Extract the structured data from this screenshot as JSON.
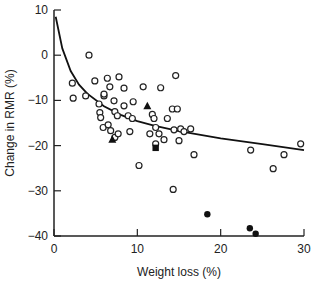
{
  "chart_data": {
    "type": "scatter",
    "title": "",
    "xlabel": "Weight loss (%)",
    "ylabel": "Change in RMR (%)",
    "xlim": [
      0,
      30
    ],
    "ylim": [
      -40,
      10
    ],
    "xticks": [
      0,
      10,
      20,
      30
    ],
    "yticks": [
      10,
      0,
      -10,
      -20,
      -30,
      -40
    ],
    "grid": false,
    "legend": null,
    "series": [
      {
        "name": "open circles",
        "marker": "circle-open",
        "points": [
          [
            4.2,
            0
          ],
          [
            2.2,
            -6.2
          ],
          [
            2.3,
            -9.5
          ],
          [
            4.9,
            -5.7
          ],
          [
            6.4,
            -5.1
          ],
          [
            7.8,
            -4.8
          ],
          [
            3.8,
            -9.0
          ],
          [
            6.0,
            -9.0
          ],
          [
            6.0,
            -8.6
          ],
          [
            6.7,
            -7.0
          ],
          [
            8.4,
            -7.3
          ],
          [
            10.7,
            -7.0
          ],
          [
            5.4,
            -10.8
          ],
          [
            7.2,
            -10.1
          ],
          [
            8.4,
            -11.2
          ],
          [
            9.5,
            -10.3
          ],
          [
            7.3,
            -12.5
          ],
          [
            7.6,
            -13.4
          ],
          [
            8.9,
            -13.4
          ],
          [
            9.4,
            -14.0
          ],
          [
            5.5,
            -12.7
          ],
          [
            5.6,
            -13.8
          ],
          [
            5.9,
            -16.0
          ],
          [
            6.5,
            -15.4
          ],
          [
            6.8,
            -16.7
          ],
          [
            7.3,
            -18.2
          ],
          [
            7.7,
            -17.4
          ],
          [
            9.1,
            -16.9
          ],
          [
            10.2,
            -24.4
          ],
          [
            14.6,
            -4.5
          ],
          [
            12.8,
            -7.2
          ],
          [
            11.8,
            -13.1
          ],
          [
            12.2,
            -16.0
          ],
          [
            12.0,
            -14.0
          ],
          [
            11.5,
            -17.4
          ],
          [
            12.6,
            -17.4
          ],
          [
            13.6,
            -14.0
          ],
          [
            14.2,
            -11.9
          ],
          [
            14.8,
            -11.9
          ],
          [
            14.4,
            -16.5
          ],
          [
            13.2,
            -18.7
          ],
          [
            15.2,
            -16.3
          ],
          [
            15.6,
            -16.9
          ],
          [
            16.4,
            -16.3
          ],
          [
            15.0,
            -18.9
          ],
          [
            16.8,
            -22.0
          ],
          [
            14.3,
            -29.7
          ],
          [
            23.6,
            -21.0
          ],
          [
            27.6,
            -22.0
          ],
          [
            26.3,
            -25.1
          ],
          [
            29.6,
            -19.6
          ],
          [
            12.2,
            -19.6
          ]
        ]
      },
      {
        "name": "filled triangles",
        "marker": "triangle-filled",
        "points": [
          [
            7.0,
            -18.7
          ],
          [
            11.2,
            -11.3
          ]
        ]
      },
      {
        "name": "filled square",
        "marker": "square-filled",
        "points": [
          [
            12.2,
            -20.5
          ]
        ]
      },
      {
        "name": "filled circles",
        "marker": "circle-filled",
        "points": [
          [
            18.4,
            -35.2
          ],
          [
            23.5,
            -38.3
          ],
          [
            24.2,
            -39.5
          ]
        ]
      }
    ],
    "fit_curve": {
      "description": "decreasing fitted curve",
      "points": [
        [
          0.2,
          8.5
        ],
        [
          1,
          1.5
        ],
        [
          2,
          -3.5
        ],
        [
          3,
          -6.5
        ],
        [
          4,
          -8.5
        ],
        [
          6,
          -11.3
        ],
        [
          8,
          -13.2
        ],
        [
          10,
          -14.6
        ],
        [
          12,
          -15.6
        ],
        [
          15,
          -16.8
        ],
        [
          20,
          -18.4
        ],
        [
          25,
          -19.7
        ],
        [
          30,
          -21.0
        ]
      ]
    }
  }
}
